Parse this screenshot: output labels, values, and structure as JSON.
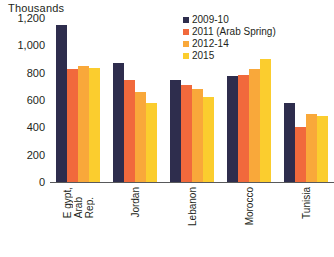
{
  "chart_data": {
    "type": "bar",
    "title": "",
    "axis_title": "Thousands",
    "xlabel": "",
    "ylabel": "Thousands",
    "ylim": [
      0,
      1200
    ],
    "yticks": [
      "1,200",
      "1,000",
      "800",
      "600",
      "400",
      "200",
      "0"
    ],
    "ytick_values": [
      1200,
      1000,
      800,
      600,
      400,
      200,
      0
    ],
    "grid": false,
    "legend_position": "top-right",
    "categories": [
      "Egypt, Arab Rep.",
      "Jordan",
      "Lebanon",
      "Morocco",
      "Tunisia"
    ],
    "category_lines": [
      [
        "E gypt,",
        "Arab",
        "Rep."
      ],
      [
        "Jordan"
      ],
      [
        "Lebanon"
      ],
      [
        "Morocco"
      ],
      [
        "Tunisia"
      ]
    ],
    "series": [
      {
        "name": "2009-10",
        "color": "#2e2d4d",
        "values": [
          1150,
          870,
          750,
          775,
          575
        ]
      },
      {
        "name": "2011 (Arab Spring)",
        "color": "#f1693c",
        "values": [
          830,
          745,
          710,
          780,
          400
        ]
      },
      {
        "name": "2012-14",
        "color": "#f9a council",
        "values": [
          850,
          660,
          680,
          830,
          500
        ]
      },
      {
        "name": "2015",
        "color": "#fbc e2b",
        "values": [
          835,
          580,
          620,
          900,
          480
        ]
      }
    ]
  },
  "colors": {
    "series_2009_10": "#2e2d4d",
    "series_2011": "#f1693c",
    "series_2012_14": "#f9a83a",
    "series_2015": "#fbcd2e",
    "axis": "#58595b",
    "text": "#231f20",
    "background": "#ffffff"
  }
}
